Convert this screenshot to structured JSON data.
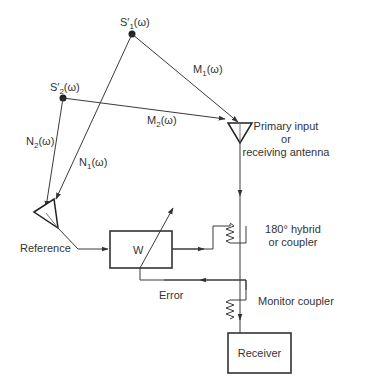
{
  "diagram": {
    "sources": [
      {
        "id": "s1",
        "label": "S",
        "prime": "′",
        "sub": "1",
        "arg": "(ω)"
      },
      {
        "id": "s2",
        "label": "S",
        "prime": "′",
        "sub": "2",
        "arg": "(ω)"
      }
    ],
    "paths": [
      {
        "id": "m1",
        "label": "M",
        "sub": "1",
        "arg": "(ω)",
        "from": "s1",
        "to": "primary-antenna"
      },
      {
        "id": "m2",
        "label": "M",
        "sub": "2",
        "arg": "(ω)",
        "from": "s2",
        "to": "primary-antenna"
      },
      {
        "id": "n1",
        "label": "N",
        "sub": "1",
        "arg": "(ω)",
        "from": "s1",
        "to": "reference-antenna"
      },
      {
        "id": "n2",
        "label": "N",
        "sub": "2",
        "arg": "(ω)",
        "from": "s2",
        "to": "reference-antenna"
      }
    ],
    "primary_antenna": {
      "line1": "Primary input",
      "line2": "or",
      "line3": "receiving antenna"
    },
    "hybrid": {
      "line1": "180° hybrid",
      "line2": "or coupler"
    },
    "monitor": {
      "label": "Monitor coupler"
    },
    "reference": {
      "label": "Reference"
    },
    "weight_block": {
      "label": "W"
    },
    "error": {
      "label": "Error"
    },
    "receiver": {
      "label": "Receiver"
    }
  }
}
